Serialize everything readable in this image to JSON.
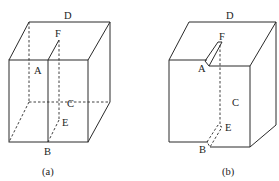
{
  "figures": [
    {
      "id": "a",
      "caption": "(a)",
      "labels": {
        "A": "A",
        "B": "B",
        "C": "C",
        "D": "D",
        "E": "E",
        "F": "F"
      }
    },
    {
      "id": "b",
      "caption": "(b)",
      "labels": {
        "A": "A",
        "B": "B",
        "C": "C",
        "D": "D",
        "E": "E",
        "F": "F"
      }
    }
  ],
  "colors": {
    "line": "#2a2a2a",
    "background": "#ffffff"
  }
}
